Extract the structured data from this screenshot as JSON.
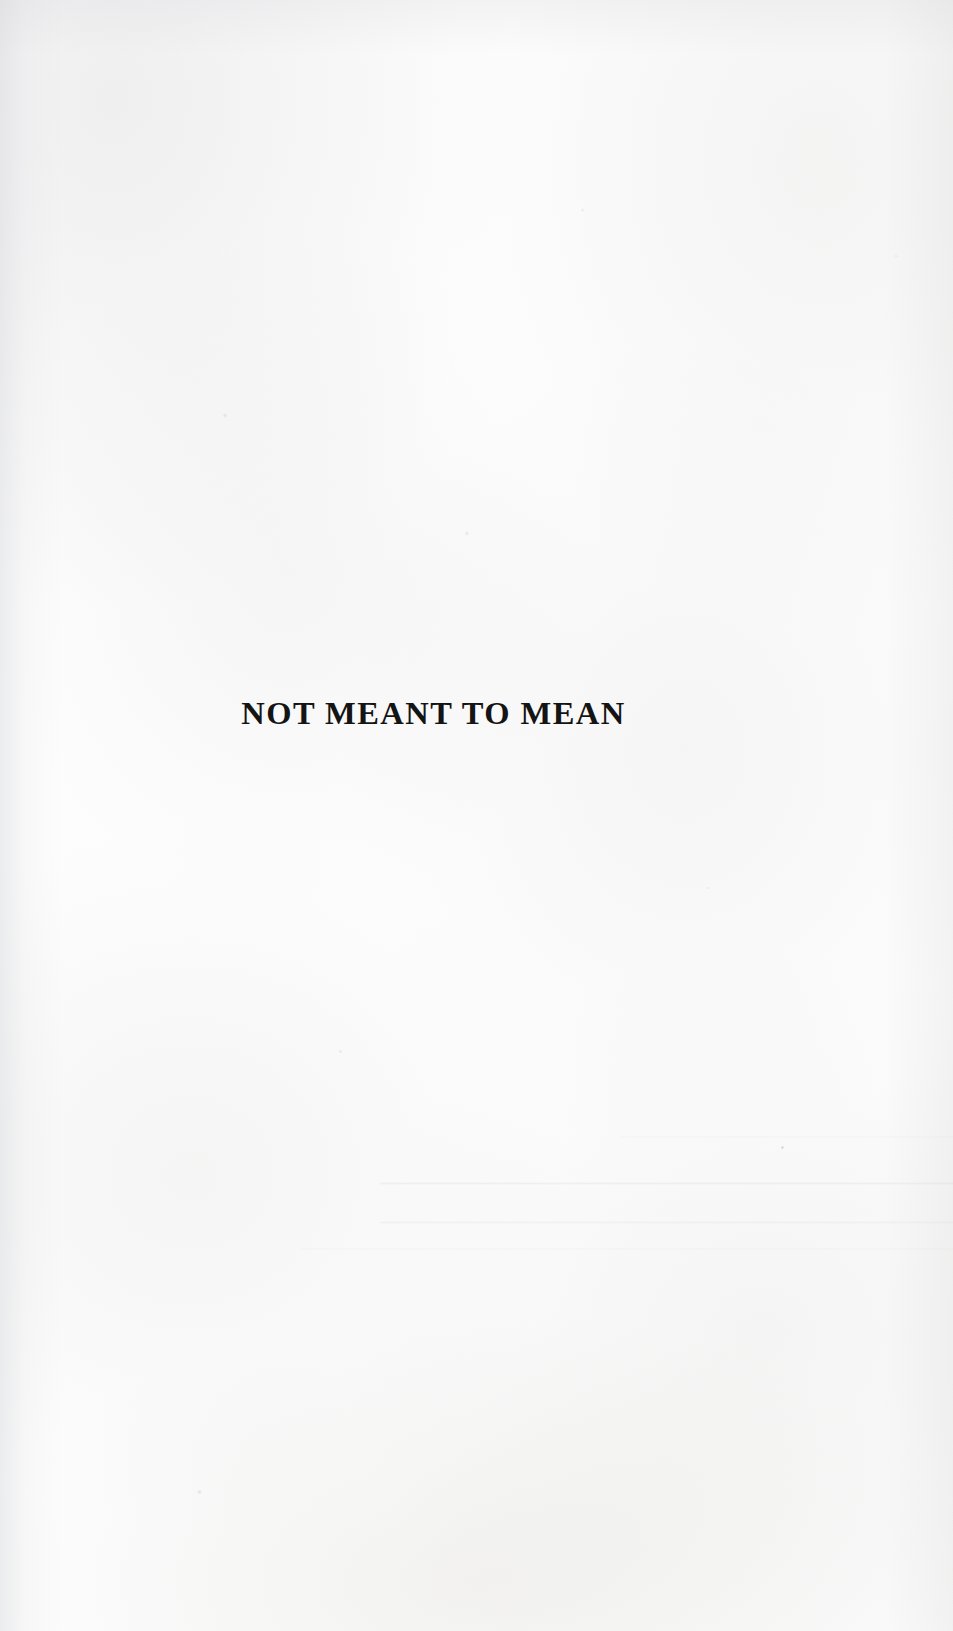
{
  "page": {
    "kind": "scanned-book-half-title-page",
    "width": 953,
    "height": 1631,
    "paper_color": "#fdfdfd",
    "ink_color": "#141414"
  },
  "title": {
    "text": "NOT MEANT TO MEAN"
  }
}
